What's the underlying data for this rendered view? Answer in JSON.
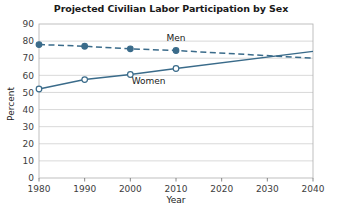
{
  "chart_data": {
    "type": "line",
    "title": "Projected Civilian Labor Participation by Sex",
    "xlabel": "Year",
    "ylabel": "Percent",
    "x": [
      1980,
      1990,
      2000,
      2010,
      2040
    ],
    "xlim": [
      1980,
      2040
    ],
    "ylim": [
      0,
      90
    ],
    "xticks": [
      "1980",
      "1990",
      "2000",
      "2010",
      "2020",
      "2030",
      "2040"
    ],
    "xtick_values": [
      1980,
      1990,
      2000,
      2010,
      2020,
      2030,
      2040
    ],
    "yticks": [
      "0",
      "10",
      "20",
      "30",
      "40",
      "50",
      "60",
      "70",
      "80",
      "90"
    ],
    "ytick_values": [
      0,
      10,
      20,
      30,
      40,
      50,
      60,
      70,
      80,
      90
    ],
    "grid": "horizontal",
    "legend": "inline-labels",
    "accent_color": "#3a6b8a",
    "grid_color": "#c9c9c9",
    "series": [
      {
        "name": "Men",
        "label": "Men",
        "style": "dashed",
        "marker": "filled-circle",
        "x": [
          1980,
          1990,
          2000,
          2010,
          2040
        ],
        "values": [
          78,
          77,
          75.5,
          74.5,
          70
        ],
        "label_x": 2010,
        "label_y": 80
      },
      {
        "name": "Women",
        "label": "Women",
        "style": "solid",
        "marker": "open-circle",
        "x": [
          1980,
          1990,
          2000,
          2010,
          2040
        ],
        "values": [
          52,
          57.5,
          60.5,
          64,
          74
        ],
        "label_x": 2004,
        "label_y": 55
      }
    ]
  }
}
